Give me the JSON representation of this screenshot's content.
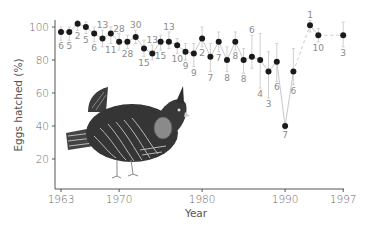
{
  "chart_data": {
    "type": "line",
    "title": "",
    "xlabel": "Year",
    "ylabel": "Eggs hatched (%)",
    "xlim": [
      1963,
      1997
    ],
    "ylim": [
      0,
      100
    ],
    "x_ticks": [
      1963,
      1970,
      1980,
      1990,
      1997
    ],
    "y_ticks": [
      20,
      40,
      60,
      80,
      100
    ],
    "grid": false,
    "legend": null,
    "illustration": "greater prairie chicken (bird drawing inside plot area)",
    "annotation": "numbers next to points are sample sizes (n nests); vertical bars show error ranges",
    "series": [
      {
        "name": "Eggs hatched (%)",
        "x": [
          1963,
          1964,
          1965,
          1966,
          1967,
          1968,
          1969,
          1970,
          1971,
          1972,
          1973,
          1974,
          1975,
          1976,
          1977,
          1978,
          1979,
          1980,
          1981,
          1982,
          1983,
          1984,
          1985,
          1986,
          1987,
          1988,
          1989,
          1990,
          1991,
          1993,
          1994,
          1997
        ],
        "values": [
          97,
          97,
          102,
          100,
          96,
          93,
          96,
          91,
          91,
          94,
          87,
          84,
          91,
          91,
          89,
          85,
          84,
          93,
          82,
          91,
          80,
          91,
          80,
          82,
          80,
          73,
          79,
          40,
          73,
          101,
          95,
          95
        ],
        "n": [
          6,
          5,
          2,
          5,
          6,
          13,
          11,
          28,
          28,
          30,
          15,
          13,
          15,
          13,
          10,
          9,
          9,
          2,
          7,
          7,
          8,
          8,
          8,
          6,
          4,
          3,
          6,
          7,
          6,
          1,
          10,
          3
        ],
        "n_position": [
          "below",
          "below",
          "below",
          "below",
          "below",
          "above",
          "below",
          "above",
          "below",
          "above",
          "below",
          "above",
          "below",
          "above",
          "below",
          "below",
          "below",
          "below",
          "below",
          "below",
          "below",
          "below",
          "below",
          "above",
          "below",
          "below",
          "below",
          "below",
          "below",
          "above",
          "below",
          "below"
        ],
        "err_low": [
          92,
          92,
          98,
          96,
          91,
          88,
          90,
          86,
          87,
          90,
          82,
          80,
          86,
          87,
          84,
          80,
          76,
          88,
          73,
          85,
          73,
          86,
          72,
          75,
          63,
          57,
          67,
          38,
          65,
          97,
          91,
          88
        ],
        "err_high": [
          100,
          100,
          104,
          103,
          100,
          98,
          100,
          96,
          95,
          98,
          92,
          89,
          95,
          97,
          93,
          90,
          90,
          100,
          90,
          97,
          88,
          97,
          87,
          95,
          96,
          85,
          90,
          42,
          87,
          104,
          99,
          103
        ]
      }
    ]
  },
  "axes": {
    "x_label": "Year",
    "y_label": "Eggs hatched (%)",
    "x_tick_labels": [
      "1963",
      "1970",
      "1980",
      "1990",
      "1997"
    ],
    "y_tick_labels": [
      "20",
      "40",
      "60",
      "80",
      "100"
    ]
  },
  "colors": {
    "marker": "#1a1a1a",
    "line": "#c8c8c8",
    "error_bar": "#d0d0d0",
    "axis": "#555555",
    "label": "#8a8a8a",
    "bird_body": "#3a3a3a",
    "bird_air_sac": "#8a8a8a"
  }
}
